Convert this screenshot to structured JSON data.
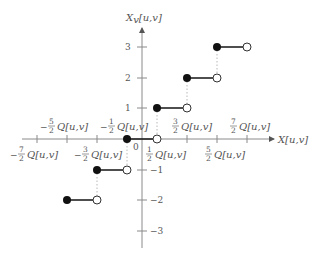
{
  "diagram": {
    "x_axis_label": "X[u,v]",
    "y_axis_label": "Xv[u,v]",
    "y_axis_label_main": "X",
    "y_axis_label_sub": "v",
    "y_axis_label_rest": "[u,v]",
    "origin_label": "0",
    "colors": {
      "axis": "#8a8a8a",
      "step": "#222222",
      "dotted": "#b8b8b8",
      "text": "#555555"
    },
    "x_ticks_upper": [
      {
        "sign": "−",
        "num": "5",
        "den": "2",
        "suffix": "Q[u,v]"
      },
      {
        "sign": "−",
        "num": "1",
        "den": "2",
        "suffix": "Q[u,v]"
      },
      {
        "sign": "",
        "num": "3",
        "den": "2",
        "suffix": "Q[u,v]"
      },
      {
        "sign": "",
        "num": "7",
        "den": "2",
        "suffix": "Q[u,v]"
      }
    ],
    "x_ticks_lower": [
      {
        "sign": "−",
        "num": "7",
        "den": "2",
        "suffix": "Q[u,v]"
      },
      {
        "sign": "−",
        "num": "3",
        "den": "2",
        "suffix": "Q[u,v]"
      },
      {
        "sign": "",
        "num": "1",
        "den": "2",
        "suffix": "Q[u,v]"
      },
      {
        "sign": "",
        "num": "5",
        "den": "2",
        "suffix": "Q[u,v]"
      }
    ],
    "y_ticks": [
      {
        "value": 3,
        "label": "3"
      },
      {
        "value": 2,
        "label": "2"
      },
      {
        "value": 1,
        "label": "1"
      },
      {
        "value": -1,
        "label": "−1"
      },
      {
        "value": -2,
        "label": "−2"
      },
      {
        "value": -3,
        "label": "−3"
      }
    ],
    "steps": [
      {
        "level": -2,
        "x_start": "-5/2 Q",
        "x_end": "-3/2 Q"
      },
      {
        "level": -1,
        "x_start": "-3/2 Q",
        "x_end": "-1/2 Q"
      },
      {
        "level": 0,
        "x_start": "-1/2 Q",
        "x_end": "1/2 Q"
      },
      {
        "level": 1,
        "x_start": "1/2 Q",
        "x_end": "3/2 Q"
      },
      {
        "level": 2,
        "x_start": "3/2 Q",
        "x_end": "5/2 Q"
      },
      {
        "level": 3,
        "x_start": "5/2 Q",
        "x_end": "7/2 Q"
      }
    ]
  }
}
